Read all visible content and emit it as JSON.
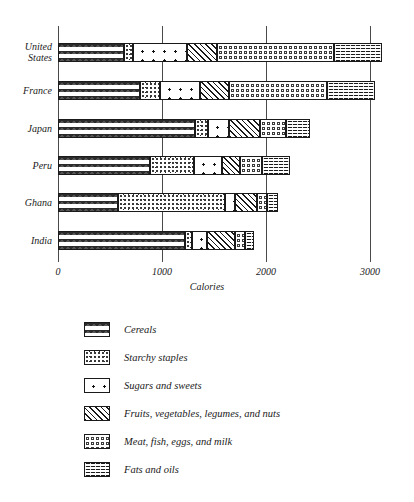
{
  "chart_data": {
    "type": "bar",
    "subtype": "stacked-horizontal",
    "title": "",
    "xlabel": "Calories",
    "ylabel": "",
    "xlim": [
      0,
      3300
    ],
    "xticks": [
      0,
      1000,
      2000,
      3000
    ],
    "xtick_labels": [
      "0",
      "1000",
      "2000",
      "3000"
    ],
    "grid": true,
    "legend_position": "below",
    "categories": [
      "United States",
      "France",
      "Japan",
      "Peru",
      "Ghana",
      "India"
    ],
    "series": [
      {
        "name": "Cereals",
        "pattern": "chevron-dark",
        "values": [
          630,
          790,
          1320,
          885,
          575,
          1220
        ]
      },
      {
        "name": "Starchy staples",
        "pattern": "fine-dots",
        "values": [
          95,
          190,
          120,
          425,
          1030,
          70
        ]
      },
      {
        "name": "Sugars and sweets",
        "pattern": "sparse-star-dots",
        "values": [
          520,
          390,
          200,
          270,
          95,
          145
        ]
      },
      {
        "name": "Fruits, vegetables, legumes, and nuts",
        "pattern": "diagonal-hatch",
        "values": [
          285,
          270,
          300,
          170,
          210,
          265
        ]
      },
      {
        "name": "Meat, fish, eggs, and milk",
        "pattern": "open-circles",
        "values": [
          1120,
          950,
          250,
          210,
          100,
          100
        ]
      },
      {
        "name": "Fats and oils",
        "pattern": "wavy-horizontal",
        "values": [
          470,
          460,
          230,
          270,
          105,
          80
        ]
      }
    ],
    "totals": [
      3120,
      3050,
      2420,
      2230,
      2115,
      1880
    ]
  },
  "axis": {
    "x_title": "Calories",
    "ticks": [
      "0",
      "1000",
      "2000",
      "3000"
    ]
  },
  "legend": {
    "items": [
      {
        "label": "Cereals"
      },
      {
        "label": "Starchy staples"
      },
      {
        "label": "Sugars and sweets"
      },
      {
        "label": "Fruits, vegetables, legumes, and nuts"
      },
      {
        "label": "Meat, fish, eggs, and milk"
      },
      {
        "label": "Fats and oils"
      }
    ]
  },
  "colors": {
    "ink": "#1a1a1a",
    "grid": "#4a4a4a",
    "background": "#ffffff"
  }
}
